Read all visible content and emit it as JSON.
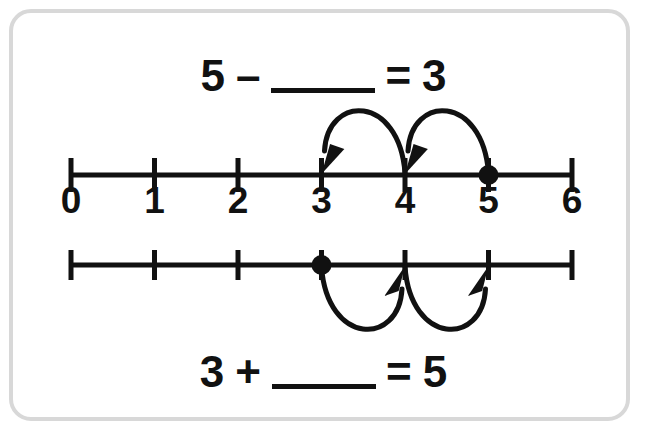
{
  "card": {
    "border_color": "#d8d8d8",
    "background": "#ffffff"
  },
  "ink_color": "#111111",
  "equations": {
    "top": {
      "left_operand": "5",
      "operator": "–",
      "blank": "",
      "equals": "=",
      "right_operand": "3",
      "full_text": "5 – ____ = 3",
      "answer_hidden": "2"
    },
    "bottom": {
      "left_operand": "3",
      "operator": "+",
      "blank": "",
      "equals": "=",
      "right_operand": "5",
      "full_text": "3 + ____ = 5",
      "answer_hidden": "2"
    }
  },
  "chart_data": {
    "type": "line",
    "xlabel": "",
    "ylabel": "",
    "grid": false,
    "legend": "none",
    "xlim": [
      0,
      6
    ],
    "tick_labels": [
      "0",
      "1",
      "2",
      "3",
      "4",
      "5",
      "6"
    ],
    "tick_values": [
      0,
      1,
      2,
      3,
      4,
      5,
      6
    ],
    "number_lines": [
      {
        "name": "subtraction-number-line",
        "labels_visible": true,
        "start_point": 5,
        "end_point": 3,
        "direction": "backward",
        "arcs_side": "above",
        "jumps": [
          {
            "from": 5,
            "to": 4,
            "direction": "left"
          },
          {
            "from": 4,
            "to": 3,
            "direction": "left"
          }
        ],
        "jump_count": 2
      },
      {
        "name": "addition-number-line",
        "labels_visible": false,
        "start_point": 3,
        "end_point": 5,
        "direction": "forward",
        "arcs_side": "below",
        "jumps": [
          {
            "from": 3,
            "to": 4,
            "direction": "right"
          },
          {
            "from": 4,
            "to": 5,
            "direction": "right"
          }
        ],
        "jump_count": 2
      }
    ]
  }
}
